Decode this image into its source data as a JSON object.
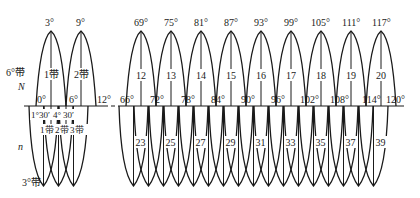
{
  "figure": {
    "left_labels": {
      "six_degree_zone": "6°带",
      "north": "N",
      "south": "n",
      "three_degree_zone": "3°带"
    },
    "left_group": {
      "six_degree_central_meridians": [
        "3°",
        "9°"
      ],
      "six_degree_zone_names": [
        "1带",
        "2带"
      ],
      "six_degree_boundaries": [
        "0°",
        "6°",
        "12°"
      ],
      "three_degree_central_meridians": [
        "1°30′",
        "4°30′"
      ],
      "three_degree_boundary_label": "",
      "three_degree_zone_names": [
        "1带",
        "2带",
        "3带"
      ],
      "tick_label_a": "1°30′",
      "tick_label_b": "4°",
      "tick_label_c": "30′"
    },
    "right_group": {
      "six_degree_central_meridians": [
        "69°",
        "75°",
        "81°",
        "87°",
        "93°",
        "99°",
        "105°",
        "111°",
        "117°"
      ],
      "six_degree_zone_numbers": [
        "12",
        "13",
        "14",
        "15",
        "16",
        "17",
        "18",
        "19",
        "20"
      ],
      "six_degree_boundaries": [
        "66°",
        "72°",
        "78°",
        "84°",
        "90°",
        "96°",
        "102°",
        "108°",
        "114°",
        "120°"
      ],
      "three_degree_zone_numbers": [
        "23",
        "25",
        "27",
        "29",
        "31",
        "33",
        "35",
        "37",
        "39"
      ]
    },
    "colors": {
      "line": "#1a1a1a",
      "background": "#ffffff"
    }
  }
}
